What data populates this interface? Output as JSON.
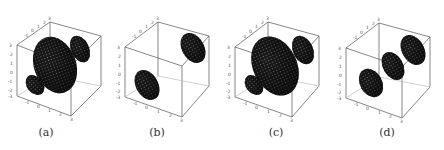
{
  "figure": {
    "panels": [
      {
        "id": "a",
        "caption": "(a)",
        "description": "large central lobe with two small side lobes"
      },
      {
        "id": "b",
        "caption": "(b)",
        "description": "two separated lobes, no central lobe"
      },
      {
        "id": "c",
        "caption": "(c)",
        "description": "large central lobe with two side lobes"
      },
      {
        "id": "d",
        "caption": "(d)",
        "description": "three aligned lobes of similar size"
      }
    ],
    "axis_ticks": {
      "vertical": [
        "3",
        "2",
        "1",
        "0",
        "-1",
        "-2",
        "-3"
      ],
      "back_top": [
        "-1",
        "0",
        "1",
        "2",
        "3"
      ],
      "bottom": [
        "-1",
        "0",
        "1",
        "2",
        "3"
      ]
    },
    "colors": {
      "surface": "#1a1a1a",
      "mesh": "#9a9a9a",
      "box": "#555555",
      "background": "#ffffff"
    }
  }
}
